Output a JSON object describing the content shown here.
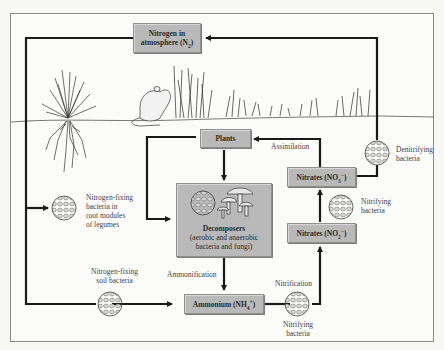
{
  "diagram": {
    "nodes": {
      "atmosphere": {
        "line1": "Nitrogen in",
        "line2": "atmosphere (N",
        "sub": "2",
        "line2_end": ")"
      },
      "plants": {
        "label": "Plants"
      },
      "decomposers": {
        "title": "Decomposers",
        "line2": "(aerobic and anaerobic",
        "line3": "bacteria and fungi)"
      },
      "ammonium": {
        "label": "Ammonium (NH",
        "sub": "4",
        "sup": "+",
        "end": ")"
      },
      "nitrites": {
        "label": "Nitrates (NO",
        "sub": "2",
        "sup": "−",
        "end": ")"
      },
      "nitrates": {
        "label": "Nitrates (NO",
        "sub": "3",
        "sup": "−",
        "end": ")"
      }
    },
    "labels": {
      "assimilation": "Assimilation",
      "denitrifying": [
        "Denitrifying",
        "bacteria"
      ],
      "nitrifying_upper": [
        "Nitrifying",
        "bacteria"
      ],
      "nitrifying_lower": [
        "Nitrifying",
        "bacteria"
      ],
      "nitrification": "Nitrification",
      "ammonification": "Ammonification",
      "nitrogen_fixing_soil": [
        "Nitrogen-fixing",
        "soil bacteria"
      ],
      "nitrogen_fixing_legumes": [
        "Nitrogen-fixing",
        "bacteria in",
        "root modules",
        "of legumes"
      ]
    },
    "illustrations": [
      "grass-plant-with-roots",
      "mouse",
      "tall-grass",
      "mushrooms",
      "bacteria-colony"
    ],
    "colors": {
      "box_fill": "#b9b9b9",
      "line": "#1a1a1a",
      "background": "#fbfbfa"
    }
  }
}
